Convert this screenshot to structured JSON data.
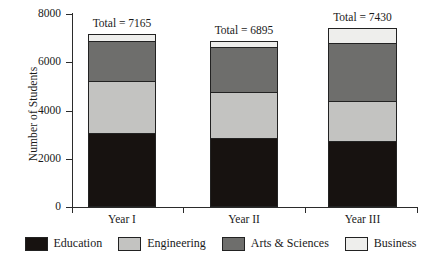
{
  "chart_data": {
    "type": "bar",
    "subtype": "stacked-bar",
    "title": "",
    "xlabel": "",
    "ylabel": "Number of Students",
    "ylim": [
      0,
      8000
    ],
    "yticks": [
      0,
      2000,
      4000,
      6000,
      8000
    ],
    "ytick_labels": [
      "0",
      "2000",
      "4000",
      "6000",
      "8000"
    ],
    "grid": false,
    "legend_position": "bottom",
    "categories": [
      "Year I",
      "Year II",
      "Year III"
    ],
    "series": [
      {
        "name": "Education",
        "color": "#171210",
        "values": [
          3070,
          2870,
          2720
        ]
      },
      {
        "name": "Engineering",
        "color": "#c3c3c1",
        "values": [
          2155,
          1900,
          1690
        ]
      },
      {
        "name": "Arts & Sciences",
        "color": "#6e6e6c",
        "values": [
          1690,
          1890,
          2430
        ]
      },
      {
        "name": "Business",
        "color": "#eeeeec",
        "values": [
          250,
          235,
          590
        ]
      }
    ],
    "totals": [
      7165,
      6895,
      7430
    ],
    "total_labels": [
      "Total = 7165",
      "Total = 6895",
      "Total = 7430"
    ],
    "stack_order_bottom_to_top": [
      "Education",
      "Engineering",
      "Arts & Sciences",
      "Business"
    ]
  },
  "legend": {
    "items": [
      {
        "label": "Education",
        "color": "#171210"
      },
      {
        "label": "Engineering",
        "color": "#c3c3c1"
      },
      {
        "label": "Arts & Sciences",
        "color": "#6e6e6c"
      },
      {
        "label": "Business",
        "color": "#eeeeec"
      }
    ]
  },
  "axes": {
    "y_label": "Number of Students",
    "y_tick_labels": [
      "8000",
      "6000",
      "4000",
      "2000",
      "0"
    ],
    "x_tick_labels": [
      "Year I",
      "Year II",
      "Year III"
    ]
  },
  "annotations": {
    "bar_totals": [
      "Total = 7165",
      "Total = 6895",
      "Total = 7430"
    ]
  }
}
